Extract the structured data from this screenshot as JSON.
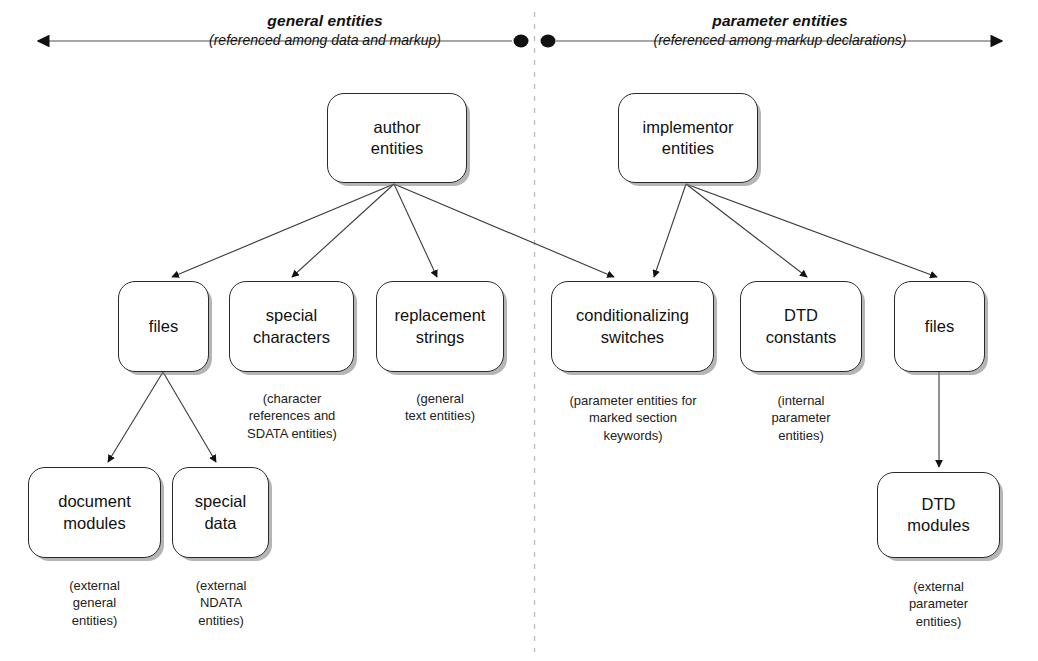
{
  "diagram": {
    "title_left": "general entities",
    "subtitle_left": "(referenced among data and markup)",
    "title_right": "parameter entities",
    "subtitle_right": "(referenced among markup declarations)",
    "stroke_color": "#2a2a2a",
    "divider_color": "#b9b9b9",
    "axis_color": "#8a8a8a"
  },
  "nodes": {
    "author_entities": "author\nentities",
    "author_entities_l1": "author",
    "author_entities_l2": "entities",
    "implementor_entities_l1": "implementor",
    "implementor_entities_l2": "entities",
    "files_left": "files",
    "special_characters_l1": "special",
    "special_characters_l2": "characters",
    "replacement_strings_l1": "replacement",
    "replacement_strings_l2": "strings",
    "conditionalizing_switches_l1": "conditionalizing",
    "conditionalizing_switches_l2": "switches",
    "dtd_constants_l1": "DTD",
    "dtd_constants_l2": "constants",
    "files_right": "files",
    "document_modules_l1": "document",
    "document_modules_l2": "modules",
    "special_data_l1": "special",
    "special_data_l2": "data",
    "dtd_modules_l1": "DTD",
    "dtd_modules_l2": "modules"
  },
  "captions": {
    "special_characters": "(character\nreferences and\nSDATA entities)",
    "special_characters_l1": "(character",
    "special_characters_l2": "references and",
    "special_characters_l3": "SDATA entities)",
    "replacement_strings_l1": "(general",
    "replacement_strings_l2": "text entities)",
    "conditionalizing_switches_l1": "(parameter entities for",
    "conditionalizing_switches_l2": "marked section",
    "conditionalizing_switches_l3": "keywords)",
    "dtd_constants_l1": "(internal",
    "dtd_constants_l2": "parameter",
    "dtd_constants_l3": "entities)",
    "document_modules_l1": "(external",
    "document_modules_l2": "general",
    "document_modules_l3": "entities)",
    "special_data_l1": "(external",
    "special_data_l2": "NDATA",
    "special_data_l3": "entities)",
    "dtd_modules_l1": "(external",
    "dtd_modules_l2": "parameter",
    "dtd_modules_l3": "entities)"
  }
}
